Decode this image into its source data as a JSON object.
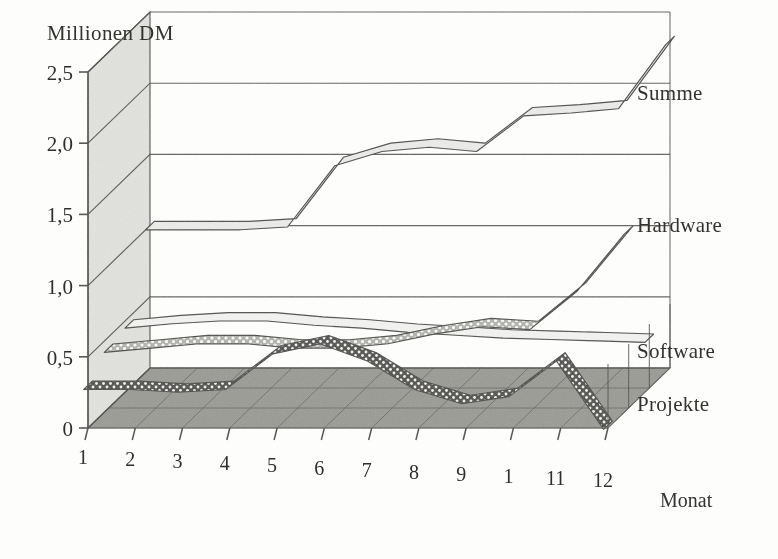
{
  "figure": {
    "y_axis_title": "Millionen DM",
    "x_axis_title": "Monat"
  },
  "axes": {
    "y_ticks": [
      "0",
      "0,5",
      "1,0",
      "1,5",
      "2,0",
      "2,5"
    ],
    "x_ticks": [
      "1",
      "2",
      "3",
      "4",
      "5",
      "6",
      "7",
      "8",
      "9",
      "1",
      "11",
      "12"
    ]
  },
  "series_labels": {
    "summe": "Summe",
    "hardware": "Hardware",
    "software": "Software",
    "projekte": "Projekte"
  },
  "colors": {
    "background": "#fdfdfc",
    "ink": "#4a4946",
    "wall_panel": "#e2e2de",
    "floor": "#9a9a95",
    "floor_grid": "#636360",
    "summe_fill": "#ececeb",
    "hardware_fill": "#f4f4f2",
    "software_fill": "#c9c9c5",
    "projekte_fill": "#4e4d4a"
  },
  "chart_data": {
    "type": "area",
    "title": "Millionen DM",
    "subtitle": "",
    "xlabel": "Monat",
    "ylabel": "Millionen DM",
    "x": [
      1,
      2,
      3,
      4,
      5,
      6,
      7,
      8,
      9,
      10,
      11,
      12
    ],
    "categories": [
      "1",
      "2",
      "3",
      "4",
      "5",
      "6",
      "7",
      "8",
      "9",
      "10",
      "11",
      "12"
    ],
    "ylim": [
      0,
      2.5
    ],
    "y_ticks": [
      0,
      0.5,
      1.0,
      1.5,
      2.0,
      2.5
    ],
    "grid": true,
    "legend": "right-side series labels",
    "projection": "3d-ribbon",
    "series": [
      {
        "name": "Summe",
        "depth_index": 3,
        "values": [
          1.0,
          1.0,
          1.0,
          1.02,
          1.45,
          1.55,
          1.58,
          1.55,
          1.8,
          1.82,
          1.85,
          2.3
        ],
        "note": "rearmost ribbon, light fill"
      },
      {
        "name": "Hardware",
        "depth_index": 2,
        "values": [
          0.45,
          0.48,
          0.5,
          0.5,
          0.47,
          0.45,
          0.42,
          0.4,
          0.38,
          0.37,
          0.36,
          0.35
        ],
        "note": "thin near-flat ribbon, slowly declining"
      },
      {
        "name": "Software",
        "depth_index": 1,
        "values": [
          0.42,
          0.45,
          0.48,
          0.48,
          0.45,
          0.45,
          0.48,
          0.55,
          0.6,
          0.58,
          0.85,
          1.25
        ],
        "note": "light dotted ribbon rising sharply at the end"
      },
      {
        "name": "Projekte",
        "depth_index": 0,
        "values": [
          0.3,
          0.3,
          0.28,
          0.3,
          0.55,
          0.62,
          0.5,
          0.3,
          0.2,
          0.25,
          0.5,
          0.02
        ],
        "note": "front dark dotted ribbon, oscillating then collapsing"
      }
    ]
  }
}
